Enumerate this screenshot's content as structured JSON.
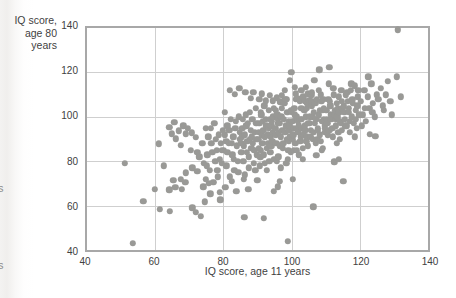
{
  "page": {
    "edge_fragments": [
      {
        "text": "s"
      },
      {
        "text": "s"
      }
    ]
  },
  "chart_data": {
    "type": "scatter",
    "title": "",
    "xlabel": "IQ score, age 11 years",
    "ylabel_line1": "IQ score,",
    "ylabel_line2": "age 80 years",
    "xlim": [
      40,
      140
    ],
    "ylim": [
      40,
      140
    ],
    "xticks": [
      40,
      60,
      80,
      100,
      120,
      140
    ],
    "yticks": [
      40,
      60,
      80,
      100,
      120,
      140
    ],
    "grid": true,
    "legend": "none",
    "point_color": "#999996",
    "grid_color": "#cfcfcf",
    "frame_color": "#a8a8a8",
    "text_color": "#3f3f3f",
    "points": [
      [
        51,
        79
      ],
      [
        53.5,
        43
      ],
      [
        56.5,
        62
      ],
      [
        59.8,
        67.5
      ],
      [
        61.1,
        87.9
      ],
      [
        61.4,
        58.3
      ],
      [
        62.5,
        78
      ],
      [
        64.1,
        67.1
      ],
      [
        64.1,
        95.3
      ],
      [
        64.3,
        57.5
      ],
      [
        64.9,
        92.4
      ],
      [
        65.3,
        71.5
      ],
      [
        65.6,
        97.5
      ],
      [
        65.9,
        68.3
      ],
      [
        66.1,
        90.1
      ],
      [
        67,
        93.8
      ],
      [
        67.5,
        71.9
      ],
      [
        67.5,
        87.1
      ],
      [
        67.8,
        67.5
      ],
      [
        68.2,
        96
      ],
      [
        68.8,
        70.5
      ],
      [
        69,
        74.8
      ],
      [
        69,
        92.4
      ],
      [
        69.5,
        94.9
      ],
      [
        70.4,
        84.9
      ],
      [
        70.7,
        92.8
      ],
      [
        70.9,
        59
      ],
      [
        70.9,
        77
      ],
      [
        71.9,
        57.1
      ],
      [
        71.9,
        90.9
      ],
      [
        72.4,
        75.5
      ],
      [
        72.4,
        84.2
      ],
      [
        72.9,
        82
      ],
      [
        73.3,
        55.3
      ],
      [
        74.1,
        68.6
      ],
      [
        74.5,
        61.7
      ],
      [
        73.8,
        88
      ],
      [
        74.2,
        79
      ],
      [
        74.8,
        95
      ],
      [
        74.9,
        72
      ],
      [
        75.1,
        78
      ],
      [
        75.3,
        83
      ],
      [
        75.6,
        91
      ],
      [
        75.8,
        70
      ],
      [
        76,
        76
      ],
      [
        76.2,
        65.3
      ],
      [
        76.3,
        95
      ],
      [
        76.5,
        88
      ],
      [
        76.8,
        84
      ],
      [
        77,
        70.5
      ],
      [
        77.3,
        97
      ],
      [
        77.6,
        80
      ],
      [
        77.8,
        90
      ],
      [
        78,
        85
      ],
      [
        78.2,
        76
      ],
      [
        78.4,
        73
      ],
      [
        78.7,
        92
      ],
      [
        78.9,
        81
      ],
      [
        79,
        66
      ],
      [
        79.1,
        62.7
      ],
      [
        79.3,
        88
      ],
      [
        79.5,
        85
      ],
      [
        79.6,
        79
      ],
      [
        79.8,
        94
      ],
      [
        80.2,
        85
      ],
      [
        80.4,
        102
      ],
      [
        80.5,
        92
      ],
      [
        80.6,
        68.3
      ],
      [
        80.8,
        89
      ],
      [
        80.9,
        78
      ],
      [
        81.1,
        84
      ],
      [
        81.2,
        96
      ],
      [
        81.5,
        88
      ],
      [
        81.7,
        94
      ],
      [
        81.8,
        112
      ],
      [
        81.9,
        73
      ],
      [
        82.2,
        99
      ],
      [
        82.4,
        88
      ],
      [
        82.5,
        70.9
      ],
      [
        82.6,
        83
      ],
      [
        82.9,
        91
      ],
      [
        83.1,
        81
      ],
      [
        83.2,
        76
      ],
      [
        83.3,
        110.2
      ],
      [
        83.5,
        95
      ],
      [
        83.7,
        98
      ],
      [
        83.8,
        66.5
      ],
      [
        83.9,
        87
      ],
      [
        84.2,
        80
      ],
      [
        84.4,
        75
      ],
      [
        84.5,
        100
      ],
      [
        84.7,
        113
      ],
      [
        84.8,
        93
      ],
      [
        84.9,
        90
      ],
      [
        85.2,
        88
      ],
      [
        85.3,
        84
      ],
      [
        85.4,
        91
      ],
      [
        85.5,
        95
      ],
      [
        85.7,
        99
      ],
      [
        85.8,
        80
      ],
      [
        85.9,
        71.9
      ],
      [
        86,
        87
      ],
      [
        86.1,
        54.7
      ],
      [
        86.2,
        92
      ],
      [
        86.3,
        74
      ],
      [
        86.4,
        111.1
      ],
      [
        86.5,
        101
      ],
      [
        86.7,
        96
      ],
      [
        86.8,
        84
      ],
      [
        87,
        89
      ],
      [
        87.1,
        97
      ],
      [
        87.3,
        67.5
      ],
      [
        87.4,
        82
      ],
      [
        87.5,
        77
      ],
      [
        87.7,
        102
      ],
      [
        87.8,
        90
      ],
      [
        88,
        108.3
      ],
      [
        88.1,
        94
      ],
      [
        88.2,
        86
      ],
      [
        88.4,
        91
      ],
      [
        88.5,
        99
      ],
      [
        88.7,
        88
      ],
      [
        88.8,
        111.1
      ],
      [
        88.9,
        79
      ],
      [
        89.1,
        85
      ],
      [
        89.2,
        93
      ],
      [
        89.4,
        76
      ],
      [
        89.5,
        104
      ],
      [
        89.6,
        90
      ],
      [
        89.7,
        97
      ],
      [
        89.8,
        83
      ],
      [
        89.9,
        71.5
      ],
      [
        90.2,
        90
      ],
      [
        90.3,
        86
      ],
      [
        90.4,
        93
      ],
      [
        90.5,
        97
      ],
      [
        90.5,
        107.8
      ],
      [
        90.7,
        78
      ],
      [
        90.8,
        82
      ],
      [
        90.9,
        102
      ],
      [
        91,
        85
      ],
      [
        91.1,
        101
      ],
      [
        91.2,
        110.4
      ],
      [
        91.3,
        92
      ],
      [
        91.4,
        88
      ],
      [
        91.6,
        98
      ],
      [
        91.7,
        94
      ],
      [
        91.8,
        83
      ],
      [
        91.9,
        54.3
      ],
      [
        92,
        105
      ],
      [
        92.1,
        79
      ],
      [
        92.2,
        91
      ],
      [
        92.4,
        99
      ],
      [
        92.4,
        107.3
      ],
      [
        92.6,
        96
      ],
      [
        92.7,
        86
      ],
      [
        92.8,
        76
      ],
      [
        93,
        92
      ],
      [
        93.2,
        88
      ],
      [
        93.3,
        103
      ],
      [
        93.4,
        95
      ],
      [
        93.5,
        80
      ],
      [
        93.6,
        109.8
      ],
      [
        93.7,
        84
      ],
      [
        93.8,
        99
      ],
      [
        93.9,
        91
      ],
      [
        94,
        96
      ],
      [
        94.1,
        87
      ],
      [
        94.2,
        98
      ],
      [
        94.3,
        89
      ],
      [
        94.4,
        107.3
      ],
      [
        94.5,
        93
      ],
      [
        94.6,
        100
      ],
      [
        94.7,
        104
      ],
      [
        94.8,
        66.5
      ],
      [
        94.9,
        81
      ],
      [
        95.2,
        95
      ],
      [
        95.3,
        103
      ],
      [
        95.4,
        92
      ],
      [
        95.5,
        88
      ],
      [
        95.6,
        108.7
      ],
      [
        95.7,
        80
      ],
      [
        95.8,
        101
      ],
      [
        95.9,
        97
      ],
      [
        96,
        68.6
      ],
      [
        96,
        99
      ],
      [
        96.1,
        82
      ],
      [
        96.3,
        93
      ],
      [
        96.4,
        97
      ],
      [
        96.5,
        70.9
      ],
      [
        96.6,
        87
      ],
      [
        96.7,
        106.8
      ],
      [
        96.8,
        91
      ],
      [
        96.9,
        77
      ],
      [
        97,
        100
      ],
      [
        97.1,
        104
      ],
      [
        97.2,
        109.8
      ],
      [
        97.3,
        94
      ],
      [
        97.4,
        86
      ],
      [
        97.6,
        88
      ],
      [
        97.7,
        99
      ],
      [
        97.9,
        106
      ],
      [
        98,
        112
      ],
      [
        98.1,
        93
      ],
      [
        98.2,
        108
      ],
      [
        98.3,
        96
      ],
      [
        98.4,
        79
      ],
      [
        98.5,
        107.8
      ],
      [
        98.6,
        90
      ],
      [
        98.7,
        102
      ],
      [
        98.8,
        81
      ],
      [
        98.9,
        44
      ],
      [
        99,
        85
      ],
      [
        99.1,
        89
      ],
      [
        99.2,
        98
      ],
      [
        99.3,
        94
      ],
      [
        99.4,
        116.4
      ],
      [
        99.5,
        96
      ],
      [
        99.6,
        91
      ],
      [
        99.7,
        103
      ],
      [
        99.8,
        84
      ],
      [
        99.9,
        120.1
      ],
      [
        100.1,
        102
      ],
      [
        100.2,
        98
      ],
      [
        100.3,
        90
      ],
      [
        100.4,
        71.9
      ],
      [
        100.5,
        92
      ],
      [
        100.6,
        95
      ],
      [
        100.7,
        85
      ],
      [
        100.8,
        104
      ],
      [
        100.9,
        113.4
      ],
      [
        101,
        101
      ],
      [
        101.1,
        88
      ],
      [
        101.2,
        110.4
      ],
      [
        101.3,
        108
      ],
      [
        101.4,
        100
      ],
      [
        101.6,
        85
      ],
      [
        101.7,
        95
      ],
      [
        101.8,
        98
      ],
      [
        101.9,
        108.2
      ],
      [
        102,
        93
      ],
      [
        102.1,
        83
      ],
      [
        102.2,
        96
      ],
      [
        102.4,
        107
      ],
      [
        102.5,
        89
      ],
      [
        102.6,
        99
      ],
      [
        102.7,
        91
      ],
      [
        102.8,
        104
      ],
      [
        102.9,
        112
      ],
      [
        103,
        99
      ],
      [
        103.1,
        95
      ],
      [
        103.2,
        81
      ],
      [
        103.3,
        86
      ],
      [
        103.4,
        109
      ],
      [
        103.5,
        92
      ],
      [
        103.7,
        103
      ],
      [
        103.8,
        96
      ],
      [
        103.9,
        107
      ],
      [
        104,
        94
      ],
      [
        104.1,
        113.4
      ],
      [
        104.2,
        100
      ],
      [
        104.3,
        89
      ],
      [
        104.4,
        91
      ],
      [
        104.5,
        104
      ],
      [
        104.6,
        106
      ],
      [
        104.7,
        87
      ],
      [
        104.8,
        110.4
      ],
      [
        104.9,
        97
      ],
      [
        105.2,
        107.6
      ],
      [
        105.3,
        100
      ],
      [
        105.4,
        97
      ],
      [
        105.6,
        94
      ],
      [
        105.7,
        91
      ],
      [
        105.8,
        110
      ],
      [
        105.9,
        105
      ],
      [
        106,
        111.2
      ],
      [
        106.1,
        107
      ],
      [
        106.2,
        90
      ],
      [
        106.3,
        100
      ],
      [
        106.4,
        59.5
      ],
      [
        106.5,
        102
      ],
      [
        106.6,
        93
      ],
      [
        106.7,
        116.4
      ],
      [
        106.8,
        97
      ],
      [
        107,
        106
      ],
      [
        107.1,
        88
      ],
      [
        107.2,
        82.8
      ],
      [
        107.3,
        99
      ],
      [
        107.4,
        108
      ],
      [
        107.5,
        90
      ],
      [
        107.6,
        94
      ],
      [
        107.7,
        95
      ],
      [
        107.9,
        112
      ],
      [
        108,
        101
      ],
      [
        108.1,
        121.2
      ],
      [
        108.2,
        103
      ],
      [
        108.3,
        92
      ],
      [
        108.5,
        89
      ],
      [
        108.6,
        110
      ],
      [
        108.7,
        107
      ],
      [
        108.8,
        85
      ],
      [
        108.9,
        98
      ],
      [
        109.1,
        103
      ],
      [
        109.2,
        86
      ],
      [
        109.3,
        108
      ],
      [
        109.4,
        99
      ],
      [
        109.5,
        104
      ],
      [
        109.7,
        96
      ],
      [
        109.8,
        95
      ],
      [
        109.9,
        93
      ],
      [
        110.2,
        103
      ],
      [
        110.4,
        99
      ],
      [
        110.5,
        97
      ],
      [
        110.7,
        92
      ],
      [
        110.8,
        108
      ],
      [
        110.9,
        115
      ],
      [
        111,
        122.4
      ],
      [
        111.1,
        94
      ],
      [
        111.2,
        107
      ],
      [
        111.4,
        105
      ],
      [
        111.5,
        101
      ],
      [
        111.7,
        99
      ],
      [
        111.9,
        95
      ],
      [
        112.1,
        91
      ],
      [
        112.2,
        113
      ],
      [
        112.4,
        110
      ],
      [
        112.5,
        79.8
      ],
      [
        112.6,
        103
      ],
      [
        112.7,
        101
      ],
      [
        112.9,
        99
      ],
      [
        113,
        96
      ],
      [
        113.2,
        88
      ],
      [
        113.3,
        106
      ],
      [
        113.4,
        100
      ],
      [
        113.5,
        104
      ],
      [
        113.7,
        93
      ],
      [
        113.8,
        109
      ],
      [
        113.9,
        81
      ],
      [
        114,
        102
      ],
      [
        114.2,
        90
      ],
      [
        114.3,
        98
      ],
      [
        114.5,
        97
      ],
      [
        114.6,
        112
      ],
      [
        114.7,
        94
      ],
      [
        114.8,
        107
      ],
      [
        114.9,
        104
      ],
      [
        115.2,
        70.9
      ],
      [
        115.3,
        105
      ],
      [
        115.5,
        102
      ],
      [
        115.6,
        99
      ],
      [
        115.8,
        96
      ],
      [
        115.9,
        110
      ],
      [
        116.2,
        96
      ],
      [
        116.3,
        111
      ],
      [
        116.5,
        107
      ],
      [
        116.7,
        104
      ],
      [
        116.8,
        102
      ],
      [
        117,
        98
      ],
      [
        117.1,
        93
      ],
      [
        117.4,
        112
      ],
      [
        117.5,
        115
      ],
      [
        117.7,
        100
      ],
      [
        117.8,
        108
      ],
      [
        118,
        106
      ],
      [
        118.3,
        97
      ],
      [
        118.5,
        91
      ],
      [
        118.6,
        114
      ],
      [
        118.8,
        99
      ],
      [
        118.9,
        103
      ],
      [
        119.2,
        95
      ],
      [
        119.3,
        105
      ],
      [
        119.5,
        109
      ],
      [
        119.6,
        112
      ],
      [
        119.8,
        101
      ],
      [
        120.3,
        107
      ],
      [
        120.5,
        96
      ],
      [
        120.8,
        101
      ],
      [
        121.3,
        112
      ],
      [
        121.5,
        104
      ],
      [
        121.8,
        98
      ],
      [
        122.3,
        109
      ],
      [
        122.5,
        118
      ],
      [
        122.8,
        104
      ],
      [
        123,
        92.3
      ],
      [
        123.4,
        115
      ],
      [
        123.7,
        102
      ],
      [
        123.9,
        106
      ],
      [
        124.4,
        100
      ],
      [
        124.5,
        91.3
      ],
      [
        124.9,
        110
      ],
      [
        125.4,
        108
      ],
      [
        126.2,
        113
      ],
      [
        126.8,
        105
      ],
      [
        127,
        103.1
      ],
      [
        127.6,
        110
      ],
      [
        128.3,
        116
      ],
      [
        128.9,
        107
      ],
      [
        129.4,
        100.9
      ],
      [
        130.8,
        118
      ],
      [
        131.1,
        139.3
      ],
      [
        132,
        109
      ]
    ]
  }
}
